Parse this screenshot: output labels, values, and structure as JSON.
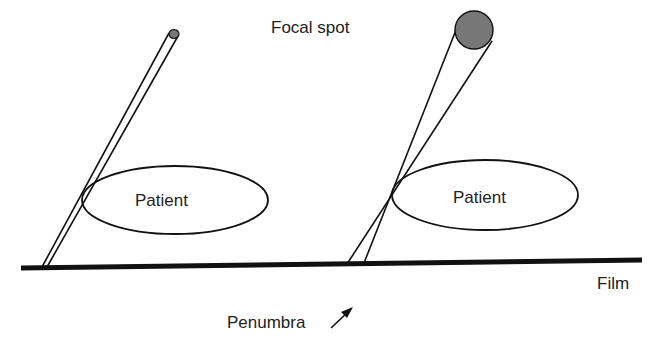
{
  "diagram": {
    "title_label": "Focal spot",
    "left_panel": {
      "patient_label": "Patient",
      "focal_spot_size": "small"
    },
    "right_panel": {
      "patient_label": "Patient",
      "focal_spot_size": "large"
    },
    "film_label": "Film",
    "penumbra_label": "Penumbra",
    "colors": {
      "line": "#111111",
      "focal_spot_fill": "#777777",
      "text": "#222222"
    }
  }
}
